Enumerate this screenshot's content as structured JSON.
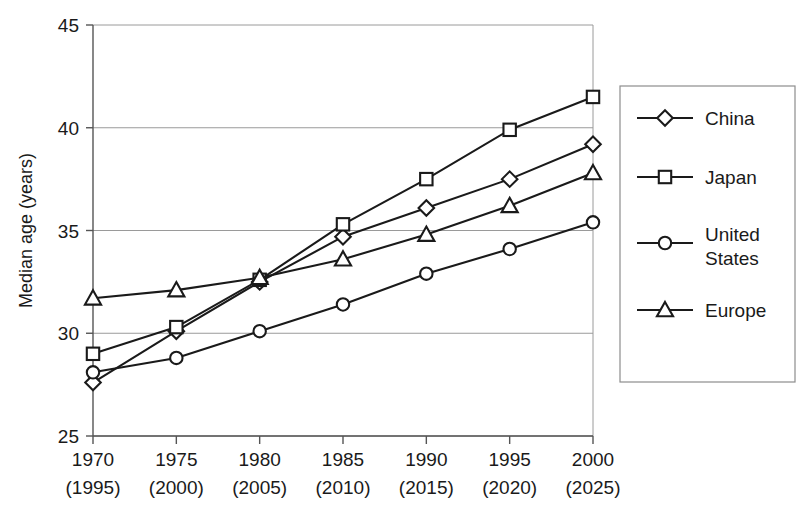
{
  "chart_data": {
    "type": "line",
    "title": "",
    "xlabel": "",
    "ylabel": "Median age (years)",
    "categories": [
      "1970",
      "1975",
      "1980",
      "1985",
      "1990",
      "1995",
      "2000"
    ],
    "category_sublabels": [
      "(1995)",
      "(2000)",
      "(2005)",
      "(2010)",
      "(2015)",
      "(2020)",
      "(2025)"
    ],
    "ylim": [
      25,
      45
    ],
    "yticks": [
      25,
      30,
      35,
      40,
      45
    ],
    "grid": true,
    "legend_position": "right",
    "series": [
      {
        "name": "China",
        "marker": "diamond",
        "values": [
          27.6,
          30.1,
          32.5,
          34.7,
          36.1,
          37.5,
          39.2
        ]
      },
      {
        "name": "Japan",
        "marker": "square",
        "values": [
          29.0,
          30.3,
          32.6,
          35.3,
          37.5,
          39.9,
          41.5
        ]
      },
      {
        "name": "United States",
        "marker": "circle",
        "values": [
          28.1,
          28.8,
          30.1,
          31.4,
          32.9,
          34.1,
          35.4
        ]
      },
      {
        "name": "Europe",
        "marker": "triangle",
        "values": [
          31.7,
          32.1,
          32.7,
          33.6,
          34.8,
          36.2,
          37.8
        ]
      }
    ]
  },
  "legend": {
    "entries": [
      {
        "label": "China",
        "marker": "diamond"
      },
      {
        "label": "Japan",
        "marker": "square"
      },
      {
        "label": "United States",
        "marker": "circle"
      },
      {
        "label": "Europe",
        "marker": "triangle"
      }
    ]
  },
  "colors": {
    "background": "#ffffff",
    "ink": "#1a1a1a",
    "grid": "#9a9a9a",
    "axis": "#555555",
    "legend_border": "#8d8d8d"
  }
}
